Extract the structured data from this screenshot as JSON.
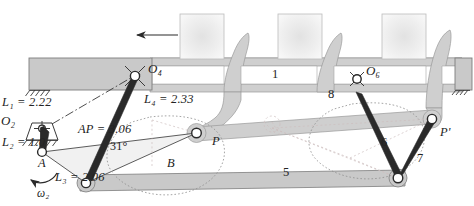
{
  "figure": {
    "type": "mechanism-linkage-diagram"
  },
  "colors": {
    "bar_fill": "#c9c9c9",
    "frame_fill": "#cfcfcf",
    "block_fill": "#ededed",
    "link_stroke": "#2a2a2a",
    "thin_stroke": "#4a4a4a",
    "dotted_stroke": "#9a9a9a",
    "faint_dashed": "#c3b7b7",
    "text": "#232323",
    "white": "#ffffff"
  },
  "dimension_labels": [
    {
      "id": "L1",
      "name": "L1",
      "base": "L",
      "sub": "1",
      "value": "2.22",
      "text": "L₁ = 2.22"
    },
    {
      "id": "L2",
      "name": "L2",
      "base": "L",
      "sub": "2",
      "value": "1.0",
      "text": "L₂ = 1.0"
    },
    {
      "id": "L3",
      "name": "L3",
      "base": "L",
      "sub": "3",
      "value": "2.06",
      "text": "L₃ = 2.06"
    },
    {
      "id": "L4",
      "name": "L4",
      "base": "L",
      "sub": "4",
      "value": "2.33",
      "text": "L₄ = 2.33"
    },
    {
      "id": "AP",
      "name": "AP",
      "base": "AP",
      "sub": "",
      "value": "3.06",
      "text": "AP = 3.06"
    }
  ],
  "angle_label": {
    "value": "31",
    "unit": "°",
    "text": "31°"
  },
  "joint_labels": [
    {
      "id": "O2",
      "base": "O",
      "sub": "2",
      "text": "O₂"
    },
    {
      "id": "O4",
      "base": "O",
      "sub": "4",
      "text": "O₄"
    },
    {
      "id": "O6",
      "base": "O",
      "sub": "6",
      "text": "O₆"
    },
    {
      "id": "A",
      "base": "A",
      "sub": "",
      "text": "A"
    },
    {
      "id": "B",
      "base": "B",
      "sub": "",
      "text": "B"
    },
    {
      "id": "P",
      "base": "P",
      "sub": "",
      "text": "P"
    },
    {
      "id": "Pp",
      "base": "P'",
      "sub": "",
      "text": "P'"
    }
  ],
  "link_numbers": [
    {
      "id": "link1",
      "text": "1"
    },
    {
      "id": "link5",
      "text": "5"
    },
    {
      "id": "link6",
      "text": "6"
    },
    {
      "id": "link7",
      "text": "7"
    },
    {
      "id": "link8",
      "text": "8"
    }
  ],
  "omega": {
    "base": "ω",
    "sub": "2",
    "text": "ω₂",
    "direction": "counterclockwise"
  },
  "motion_arrow": {
    "direction": "left",
    "name": "conveyor-travel-arrow"
  },
  "equals": "="
}
